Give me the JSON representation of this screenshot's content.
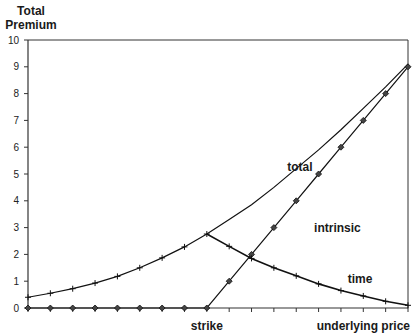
{
  "chart_data": {
    "type": "line",
    "title": "",
    "ylabel": "Total Premium",
    "ylabel_lines": [
      "Total",
      "Premium"
    ],
    "xlabel": "underlying price",
    "ylim": [
      0,
      10
    ],
    "yticks": [
      0,
      1,
      2,
      3,
      4,
      5,
      6,
      7,
      8,
      9,
      10
    ],
    "x_count": 18,
    "strike_index": 8,
    "x_tick_labels": [
      {
        "index": 8,
        "label": "strike"
      },
      {
        "index": 17,
        "label": "underlying price"
      }
    ],
    "grid": false,
    "legend": "none (inline annotations)",
    "series": [
      {
        "name": "total",
        "marker": "plus",
        "values": [
          0.4,
          0.55,
          0.72,
          0.93,
          1.18,
          1.5,
          1.87,
          2.28,
          2.76,
          3.3,
          3.85,
          4.5,
          5.2,
          5.9,
          6.65,
          7.45,
          8.25,
          9.1
        ]
      },
      {
        "name": "intrinsic",
        "marker": "diamond",
        "values": [
          0,
          0,
          0,
          0,
          0,
          0,
          0,
          0,
          0,
          1,
          2,
          3,
          4,
          5,
          6,
          7,
          8,
          9
        ]
      },
      {
        "name": "time",
        "marker": "plus",
        "values": [
          0.4,
          0.55,
          0.72,
          0.93,
          1.18,
          1.5,
          1.87,
          2.28,
          2.76,
          2.3,
          1.85,
          1.5,
          1.2,
          0.9,
          0.65,
          0.45,
          0.25,
          0.1
        ]
      }
    ],
    "annotations": [
      {
        "text": "total",
        "index": 11.6,
        "value": 5.1
      },
      {
        "text": "intrinsic",
        "index": 12.8,
        "value": 2.85
      },
      {
        "text": "time",
        "index": 14.3,
        "value": 0.95
      }
    ]
  }
}
